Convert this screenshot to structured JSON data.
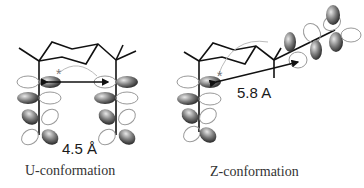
{
  "diagram": {
    "left": {
      "distance_label": "4.5 Å",
      "caption": "U-conformation",
      "marker": "*"
    },
    "right": {
      "distance_label": "5.8 A",
      "caption": "Z-conformation",
      "marker": "*"
    },
    "colors": {
      "bond": "#111111",
      "lobe_filled": "#6a6a6a",
      "lobe_outline": "#9a9a9a",
      "arc": "#bbbbbb",
      "text": "#1a1a1a"
    }
  }
}
